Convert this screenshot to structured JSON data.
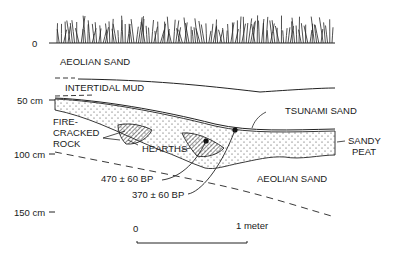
{
  "depth_axis": {
    "ticks": [
      {
        "label": "0",
        "y": 43
      },
      {
        "label": "50 cm",
        "y": 100
      },
      {
        "label": "100 cm",
        "y": 154
      },
      {
        "label": "150 cm",
        "y": 212
      }
    ]
  },
  "layers": {
    "aeolian_sand_top": "AEOLIAN SAND",
    "intertidal_mud": "INTERTIDAL MUD",
    "tsunami_sand": "TSUNAMI SAND",
    "sandy_peat_line1": "SANDY",
    "sandy_peat_line2": "PEAT",
    "aeolian_sand_bottom": "AEOLIAN SAND"
  },
  "annotations": {
    "fire_cracked_line1": "FIRE-",
    "fire_cracked_line2": "CRACKED",
    "fire_cracked_line3": "ROCK",
    "hearths": "HEARTHS",
    "date_1": "470 ± 60 BP",
    "date_2": "370 ± 60 BP"
  },
  "scale_bar": {
    "start_label": "0",
    "end_label": "1 meter"
  }
}
